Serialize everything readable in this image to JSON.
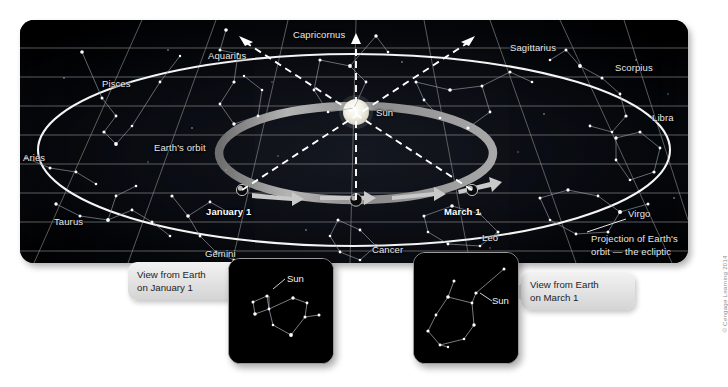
{
  "figure": {
    "credit": "© Cengage Learning 2014",
    "background_color": "#ffffff",
    "panel_color": "#000000"
  },
  "diagram": {
    "type": "astronomy-ecliptic-zodiac-diagram",
    "center_object": "Sun",
    "orbit_label": "Earth's orbit",
    "ecliptic_label_line1": "Projection of Earth's",
    "ecliptic_label_line2": "orbit — the ecliptic",
    "earth_positions": [
      {
        "label": "January 1",
        "x_pct": 32.5,
        "y_pct": 79
      },
      {
        "label": "March 1",
        "x_pct": 64.5,
        "y_pct": 79
      }
    ],
    "zodiac_constellations": [
      {
        "label": "Pisces",
        "x": 82,
        "y": 64
      },
      {
        "label": "Aquarius",
        "x": 208,
        "y": 43
      },
      {
        "label": "Capricornus",
        "x": 303,
        "y": 26
      },
      {
        "label": "Sagittarius",
        "x": 512,
        "y": 38
      },
      {
        "label": "Scorpius",
        "x": 617,
        "y": 61
      },
      {
        "label": "Libra",
        "x": 653,
        "y": 110
      },
      {
        "label": "Virgo",
        "x": 629,
        "y": 206
      },
      {
        "label": "Leo",
        "x": 484,
        "y": 232
      },
      {
        "label": "Cancer",
        "x": 374,
        "y": 243
      },
      {
        "label": "Gemini",
        "x": 205,
        "y": 248
      },
      {
        "label": "Taurus",
        "x": 53,
        "y": 215
      },
      {
        "label": "Aries",
        "x": 23,
        "y": 153
      }
    ],
    "sun_label": "Sun"
  },
  "insets": [
    {
      "id": "january",
      "callout_line1": "View from Earth",
      "callout_line2": "on January 1",
      "sun_label": "Sun",
      "constellation_shown": "Sagittarius"
    },
    {
      "id": "march",
      "callout_line1": "View from Earth",
      "callout_line2": "on March 1",
      "sun_label": "Sun",
      "constellation_shown": "Aquarius"
    }
  ],
  "colors": {
    "orbit_band": "#9e9e9e",
    "ecliptic_line": "#f2f2f2",
    "grid_line": "#8f8f8f",
    "sun": "#efefe4",
    "arrow": "#c9c9c9",
    "sight_line": "#ffffff"
  }
}
